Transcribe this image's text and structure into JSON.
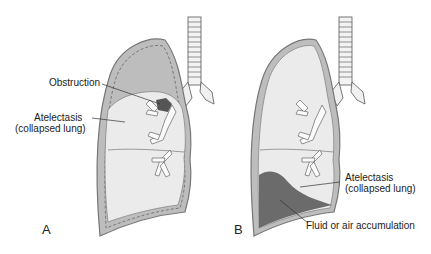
{
  "figure": {
    "panels": [
      {
        "id": "A",
        "label": "A",
        "annotations": {
          "obstruction": "Obstruction",
          "atelectasis_line1": "Atelectasis",
          "atelectasis_line2": "(collapsed lung)"
        }
      },
      {
        "id": "B",
        "label": "B",
        "annotations": {
          "atelectasis_line1": "Atelectasis",
          "atelectasis_line2": "(collapsed lung)",
          "fluid": "Fluid or air accumulation"
        }
      }
    ],
    "colors": {
      "pleural_outline": "#8a8a8a",
      "pleural_space": "#bdbdbd",
      "lung_fill": "#ebebeb",
      "fluid_fill": "#6b6b6b",
      "obstruction": "#555555",
      "line": "#333333"
    }
  }
}
